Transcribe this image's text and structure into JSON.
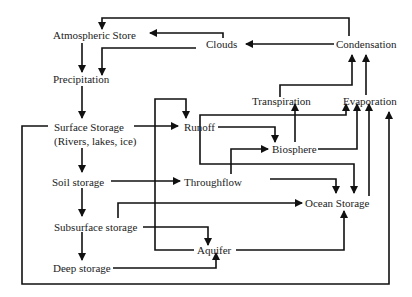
{
  "diagram": {
    "type": "flow",
    "nodes": {
      "atmospheric_store": "Atmospheric Store",
      "clouds": "Clouds",
      "condensation": "Condensation",
      "precipitation": "Precipitation",
      "transpiration": "Transpiration",
      "evaporation": "Evaporation",
      "surface_storage": "Surface Storage",
      "surface_storage_sub": "(Rivers, lakes, ice)",
      "runoff": "Runoff",
      "biosphere": "Biosphere",
      "soil_storage": "Soil storage",
      "throughflow": "Throughflow",
      "ocean_storage": "Ocean  Storage",
      "subsurface_storage": "Subsurface storage",
      "aquifer": "Aquifer",
      "deep_storage": "Deep storage"
    },
    "edges": [
      {
        "from": "Condensation",
        "to": "Atmospheric Store"
      },
      {
        "from": "Condensation",
        "to": "Clouds"
      },
      {
        "from": "Clouds",
        "to": "Atmospheric Store"
      },
      {
        "from": "Clouds",
        "to": "Precipitation"
      },
      {
        "from": "Atmospheric Store",
        "to": "Precipitation"
      },
      {
        "from": "Precipitation",
        "to": "Surface Storage"
      },
      {
        "from": "Surface Storage",
        "to": "Runoff"
      },
      {
        "from": "Surface Storage",
        "to": "Soil storage"
      },
      {
        "from": "Surface Storage",
        "to": "Evaporation"
      },
      {
        "from": "Soil storage",
        "to": "Throughflow"
      },
      {
        "from": "Soil storage",
        "to": "Subsurface storage"
      },
      {
        "from": "Soil storage",
        "to": "Evaporation"
      },
      {
        "from": "Subsurface storage",
        "to": "Deep storage"
      },
      {
        "from": "Subsurface storage",
        "to": "Aquifer"
      },
      {
        "from": "Subsurface storage",
        "to": "Ocean Storage"
      },
      {
        "from": "Deep storage",
        "to": "Aquifer"
      },
      {
        "from": "Aquifer",
        "to": "Runoff"
      },
      {
        "from": "Aquifer",
        "to": "Ocean Storage"
      },
      {
        "from": "Runoff",
        "to": "Biosphere"
      },
      {
        "from": "Runoff",
        "to": "Evaporation"
      },
      {
        "from": "Runoff",
        "to": "Ocean Storage"
      },
      {
        "from": "Throughflow",
        "to": "Biosphere"
      },
      {
        "from": "Throughflow",
        "to": "Ocean Storage"
      },
      {
        "from": "Biosphere",
        "to": "Transpiration"
      },
      {
        "from": "Biosphere",
        "to": "Evaporation"
      },
      {
        "from": "Transpiration",
        "to": "Condensation"
      },
      {
        "from": "Evaporation",
        "to": "Condensation"
      },
      {
        "from": "Ocean Storage",
        "to": "Evaporation"
      }
    ]
  }
}
